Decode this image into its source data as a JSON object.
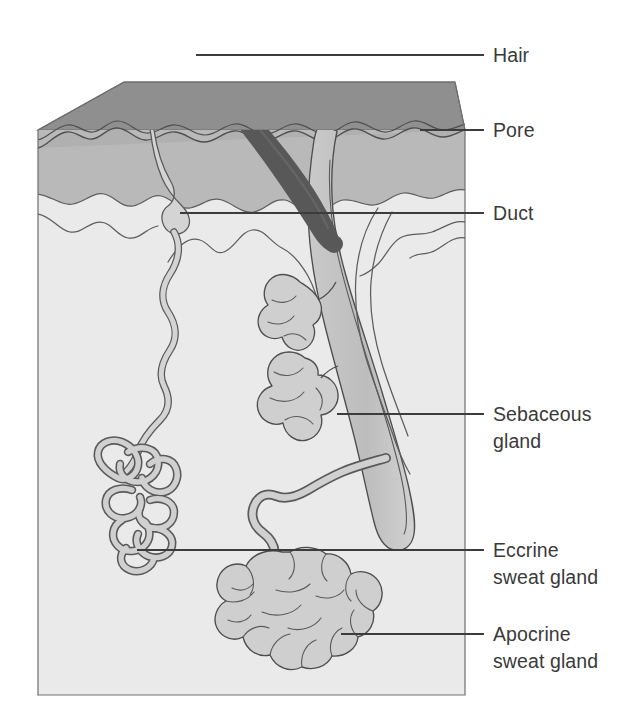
{
  "figure": {
    "type": "anatomical-diagram"
  },
  "colors": {
    "background": "#ffffff",
    "top_surface": "#8f8f8f",
    "epidermis": "#b9b9b9",
    "dermis": "#e9e9e9",
    "gland_fill": "#cfcfcf",
    "duct_fill": "#d4d4d4",
    "hair_shaft": "#585858",
    "follicle_fill": "#c6c6c6",
    "outline": "#5a5a5a",
    "leader_line": "#3c3c3c",
    "label_text": "#3a3a3a"
  },
  "labels": [
    {
      "id": "hair",
      "text": "Hair",
      "lines": [
        "Hair"
      ],
      "text_x": 493,
      "text_y": 62,
      "leader": {
        "x1": 196,
        "y1": 55,
        "x2": 484,
        "y2": 55
      }
    },
    {
      "id": "pore",
      "text": "Pore",
      "lines": [
        "Pore"
      ],
      "text_x": 493,
      "text_y": 137,
      "leader": {
        "x1": 420,
        "y1": 130,
        "x2": 484,
        "y2": 130
      }
    },
    {
      "id": "duct",
      "text": "Duct",
      "lines": [
        "Duct"
      ],
      "text_x": 493,
      "text_y": 220,
      "leader": {
        "x1": 180,
        "y1": 213,
        "x2": 484,
        "y2": 213
      }
    },
    {
      "id": "sebaceous-gland",
      "text": "Sebaceous gland",
      "lines": [
        "Sebaceous",
        "gland"
      ],
      "text_x": 493,
      "text_y": 421,
      "leader": {
        "x1": 337,
        "y1": 414,
        "x2": 484,
        "y2": 414
      }
    },
    {
      "id": "eccrine-sweat-gland",
      "text": "Eccrine sweat gland",
      "lines": [
        "Eccrine",
        "sweat gland"
      ],
      "text_x": 493,
      "text_y": 557,
      "leader": {
        "x1": 137,
        "y1": 550,
        "x2": 484,
        "y2": 550
      }
    },
    {
      "id": "apocrine-sweat-gland",
      "text": "Apocrine sweat gland",
      "lines": [
        "Apocrine",
        "sweat gland"
      ],
      "text_x": 493,
      "text_y": 641,
      "leader": {
        "x1": 341,
        "y1": 634,
        "x2": 484,
        "y2": 634
      }
    }
  ],
  "structures": [
    {
      "id": "skin-block",
      "name": "skin block"
    },
    {
      "id": "epidermis-layer",
      "name": "epidermis"
    },
    {
      "id": "dermis-layer",
      "name": "dermis"
    },
    {
      "id": "hair-shaft",
      "name": "hair shaft"
    },
    {
      "id": "hair-follicle",
      "name": "hair follicle"
    },
    {
      "id": "sebaceous-gland",
      "name": "sebaceous gland"
    },
    {
      "id": "eccrine-duct",
      "name": "eccrine duct"
    },
    {
      "id": "eccrine-coil",
      "name": "eccrine secretory coil"
    },
    {
      "id": "apocrine-duct",
      "name": "apocrine duct"
    },
    {
      "id": "apocrine-coil",
      "name": "apocrine secretory coil"
    }
  ]
}
